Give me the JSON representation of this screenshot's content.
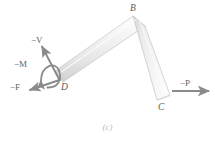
{
  "figure": {
    "caption": "(c)",
    "kind": "free-body-diagram"
  },
  "points": [
    {
      "id": "B",
      "label": "B",
      "x": 137,
      "y": 20,
      "role": "bend-corner"
    },
    {
      "id": "C",
      "label": "C",
      "x": 163,
      "y": 98,
      "role": "free-end-loaded"
    },
    {
      "id": "D",
      "label": "D",
      "x": 56,
      "y": 77,
      "role": "cut-section"
    }
  ],
  "vectors": [
    {
      "id": "minus-V",
      "sign": "−",
      "symbol": "V",
      "label": "−V",
      "type": "force",
      "at": "D",
      "direction": "up-left",
      "angle_deg": 107
    },
    {
      "id": "minus-M",
      "sign": "−",
      "symbol": "M",
      "label": "−M",
      "type": "moment",
      "at": "D",
      "direction": "counterclockwise-curved"
    },
    {
      "id": "minus-F",
      "sign": "−",
      "symbol": "F",
      "label": "−F",
      "type": "force",
      "at": "D",
      "direction": "down-left",
      "angle_deg": 207
    },
    {
      "id": "minus-P",
      "sign": "−",
      "symbol": "P",
      "label": "−P",
      "type": "force",
      "at": "C",
      "direction": "right",
      "angle_deg": 0
    }
  ],
  "colors": {
    "bar_fill_light": "#f4f4f4",
    "bar_fill_mid": "#e3e3e3",
    "bar_fill_dark": "#cfcfcf",
    "bar_stroke": "#bdbdbd",
    "arrow": "#8a8a8a",
    "label_text": "#5f5f5f",
    "caption_text": "#b8b8b8",
    "background": "#ffffff"
  }
}
